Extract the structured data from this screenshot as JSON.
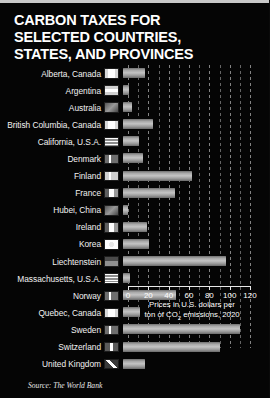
{
  "title": {
    "line1": "CARBON TAXES FOR",
    "line2": "SELECTED COUNTRIES,",
    "line3": "STATES, AND PROVINCES"
  },
  "source": "Source: The World Bank",
  "axis_caption": {
    "line1": "Prices in U.S. dollars per",
    "line2_pre": "ton of CO",
    "line2_sub": "2",
    "line2_post": " emissions, 2020"
  },
  "colors": {
    "background": "#050505",
    "bar_light": "#c4c4c4",
    "bar_dark": "#6a6a6a",
    "text": "#ffffff",
    "gridline": "#8a8a8a",
    "frame": "#c9c9c9"
  },
  "chart_data": {
    "type": "bar",
    "orientation": "horizontal",
    "title": "CARBON TAXES FOR SELECTED COUNTRIES, STATES, AND PROVINCES",
    "xlabel": "Prices in U.S. dollars per ton of CO2 emissions, 2020",
    "ylabel": "",
    "xlim": [
      0,
      120
    ],
    "xticks": [
      0,
      20,
      40,
      60,
      80,
      100,
      120
    ],
    "xtick_labels": [
      "0",
      "20",
      "40",
      "60",
      "80",
      "100",
      "120"
    ],
    "grid": true,
    "grid_axis": "x",
    "grid_style": "dashed",
    "grid_interval": 10,
    "legend": "none",
    "source": "The World Bank",
    "categories": [
      "Alberta, Canada",
      "Argentina",
      "Australia",
      "British Columbia, Canada",
      "California, U.S.A.",
      "Denmark",
      "Finland",
      "France",
      "Hubei, China",
      "Ireland",
      "Korea",
      "Liechtenstein",
      "Massachusetts, U.S.A.",
      "Norway",
      "Quebec, Canada",
      "Sweden",
      "Switzerland",
      "United Kingdom"
    ],
    "values": [
      22,
      6,
      9,
      30,
      16,
      20,
      68,
      52,
      5,
      24,
      26,
      102,
      7,
      53,
      17,
      116,
      96,
      22
    ],
    "flags": [
      "flag-alberta-canada",
      "flag-argentina",
      "flag-australia",
      "flag-british-columbia-canada",
      "flag-california-usa",
      "flag-denmark",
      "flag-finland",
      "flag-france",
      "flag-hubei-china",
      "flag-ireland",
      "flag-korea",
      "flag-liechtenstein",
      "flag-massachusetts-usa",
      "flag-norway",
      "flag-quebec-canada",
      "flag-sweden",
      "flag-switzerland",
      "flag-united-kingdom"
    ]
  }
}
